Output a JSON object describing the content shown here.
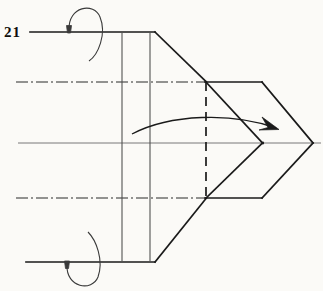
{
  "figure": {
    "label": "21",
    "kind": "engineering-line-drawing",
    "background_color": "#fbfaf7",
    "line_color": "#1a1a1a",
    "thin_line_color": "#555555",
    "centerline_color": "#2b2b2b",
    "canvas": {
      "width": 323,
      "height": 291
    }
  },
  "geometry": {
    "body": {
      "name": "shaft-body",
      "top_edge": {
        "x1": 30,
        "y1": 32,
        "x2": 155,
        "y2": 32
      },
      "bottom_edge": {
        "x1": 26,
        "y1": 262,
        "x2": 155,
        "y2": 262
      },
      "top_taper": {
        "x1": 155,
        "y1": 32,
        "x2": 206,
        "y2": 82
      },
      "bottom_taper": {
        "x1": 155,
        "y1": 262,
        "x2": 206,
        "y2": 198
      },
      "vertical_rib_1": {
        "x": 122,
        "y1": 34,
        "y2": 261
      },
      "vertical_rib_2": {
        "x": 150,
        "y1": 34,
        "y2": 261
      }
    },
    "tip": {
      "name": "chevron-point",
      "upper_flat": {
        "x1": 206,
        "y1": 82,
        "x2": 262,
        "y2": 82
      },
      "lower_flat": {
        "x1": 206,
        "y1": 198,
        "x2": 262,
        "y2": 198
      },
      "upper_outer": {
        "x1": 262,
        "y1": 82,
        "x2": 313,
        "y2": 143
      },
      "lower_outer": {
        "x1": 262,
        "y1": 198,
        "x2": 313,
        "y2": 143
      },
      "upper_inner": {
        "x1": 206,
        "y1": 82,
        "x2": 262,
        "y2": 143
      },
      "lower_inner": {
        "x1": 206,
        "y1": 198,
        "x2": 262,
        "y2": 143
      },
      "apex_outer": {
        "x": 313,
        "y": 143
      },
      "apex_inner": {
        "x": 262,
        "y": 143
      }
    },
    "hidden_line": {
      "name": "hidden-edge-dashed",
      "x": 206,
      "y1": 82,
      "y2": 198,
      "style": "dashed"
    },
    "center_axis": {
      "name": "main-center-axis",
      "x1": 18,
      "y1": 143,
      "x2": 320,
      "y2": 143,
      "style": "solid-thin"
    },
    "centerlines": [
      {
        "name": "upper-centerline",
        "x1": 16,
        "y1": 82,
        "x2": 206,
        "y2": 82,
        "style": "dash-dot"
      },
      {
        "name": "lower-centerline",
        "x1": 16,
        "y1": 198,
        "x2": 206,
        "y2": 198,
        "style": "dash-dot"
      }
    ],
    "rotation_arrows": [
      {
        "name": "top-rotation-arrow",
        "cx": 91,
        "cy": 32,
        "rx": 22,
        "ry": 30,
        "arrow_at": {
          "x": 69,
          "y": 30
        }
      },
      {
        "name": "bottom-rotation-arrow",
        "cx": 88,
        "cy": 262,
        "rx": 22,
        "ry": 30,
        "arrow_at": {
          "x": 66,
          "y": 262
        }
      }
    ],
    "direction_arrow": {
      "name": "feed-direction-arrow",
      "start": {
        "x": 132,
        "y": 134
      },
      "control": {
        "x": 205,
        "y": 112
      },
      "end": {
        "x": 278,
        "y": 128
      },
      "head_at": {
        "x": 278,
        "y": 128
      }
    }
  }
}
